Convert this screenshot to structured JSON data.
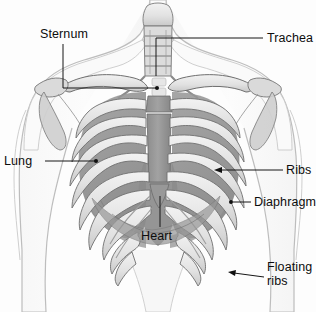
{
  "figure": {
    "background_color": "#fdfdfd",
    "width": 316,
    "height": 312,
    "style": "grayscale medical line illustration"
  },
  "palette": {
    "bone_light": "#e9e9e9",
    "bone_mid": "#d2d2d2",
    "bone_outline": "#6f6f6f",
    "soft_tissue_dark": "#8f8f8f",
    "soft_tissue_mid": "#a8a8a8",
    "body_outline": "#b6b6b6",
    "label_text": "#0d0d0d",
    "leader_line": "#161616"
  },
  "labels": [
    {
      "id": "sternum",
      "text": "Sternum",
      "x": 40,
      "y": 27,
      "anchor": "left",
      "leader": {
        "type": "elbow",
        "points": "63,44 63,88 157,88",
        "end_marker": "dot"
      }
    },
    {
      "id": "trachea",
      "text": "Trachea",
      "x": 267,
      "y": 31,
      "anchor": "left",
      "leader": {
        "type": "elbow",
        "points": "263,38 156,38 156,76",
        "end_marker": "none"
      }
    },
    {
      "id": "lung",
      "text": "Lung",
      "x": 4,
      "y": 154,
      "anchor": "left",
      "leader": {
        "type": "line",
        "points": "45,161 96,161",
        "end_marker": "dot"
      }
    },
    {
      "id": "ribs",
      "text": "Ribs",
      "x": 286,
      "y": 163,
      "anchor": "left",
      "leader": {
        "type": "arrow",
        "points": "283,170 216,170",
        "end_marker": "arrow"
      }
    },
    {
      "id": "diaphragm",
      "text": "Diaphragm",
      "x": 254,
      "y": 195,
      "anchor": "left",
      "leader": {
        "type": "line",
        "points": "251,202 231,202",
        "end_marker": "dot"
      }
    },
    {
      "id": "heart",
      "text": "Heart",
      "x": 141,
      "y": 229,
      "anchor": "left",
      "leader": {
        "type": "line",
        "points": "160,227 160,196",
        "end_marker": "none"
      }
    },
    {
      "id": "floating-ribs",
      "text": "Floating\nribs",
      "x": 267,
      "y": 260,
      "anchor": "left",
      "leader": {
        "type": "arrow",
        "points": "264,276 228,272",
        "end_marker": "arrow"
      }
    }
  ],
  "structures": [
    {
      "id": "trachea",
      "name": "Trachea",
      "description": "segmented vertical airway at the top centre"
    },
    {
      "id": "sternum",
      "name": "Sternum",
      "description": "dark vertical breastbone at the centre of the chest"
    },
    {
      "id": "clavicle-left",
      "name": "Left clavicle",
      "description": "horizontal collarbone"
    },
    {
      "id": "clavicle-right",
      "name": "Right clavicle",
      "description": "horizontal collarbone"
    },
    {
      "id": "scapula-left",
      "name": "Left scapula",
      "description": "shoulder blade"
    },
    {
      "id": "scapula-right",
      "name": "Right scapula",
      "description": "shoulder blade"
    },
    {
      "id": "ribs",
      "name": "Ribs",
      "description": "twelve paired curved bones forming the thoracic cage"
    },
    {
      "id": "lungs",
      "name": "Lungs",
      "description": "dark grey soft tissue seen through the rib cage"
    },
    {
      "id": "heart",
      "name": "Heart",
      "description": "soft tissue behind the lower sternum"
    },
    {
      "id": "diaphragm",
      "name": "Diaphragm",
      "description": "dome shaped muscle below the lungs"
    },
    {
      "id": "floating-ribs",
      "name": "Floating ribs",
      "description": "lowest two rib pairs, not joined to the sternum"
    },
    {
      "id": "torso",
      "name": "Torso outline",
      "description": "shoulders, upper arms, neck and chest contour"
    }
  ]
}
